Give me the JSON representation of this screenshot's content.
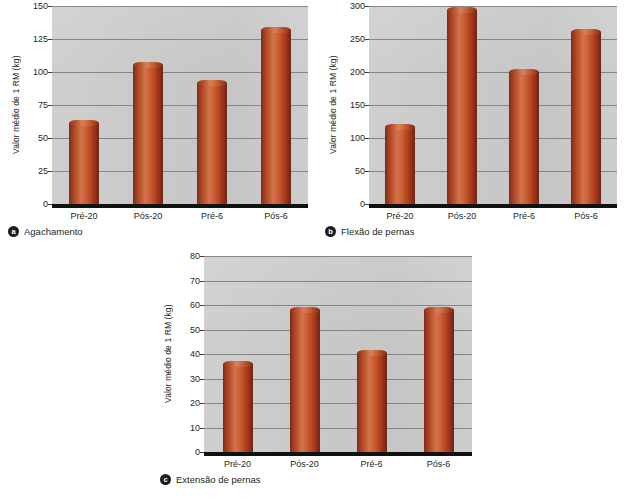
{
  "page": {
    "background": "#ffffff",
    "bar_color": "#c0572f",
    "plot_background": "#c8c8c8",
    "grid_color": "#6e6e6e",
    "axis_color": "#111111",
    "footer_note": ""
  },
  "charts": [
    {
      "panel_letter": "a",
      "caption": "Agachamento",
      "ylabel": "Valor médio de 1 RM (kg)",
      "ticks": [
        0,
        25,
        50,
        75,
        100,
        125,
        150
      ],
      "categories": [
        "Pré-20",
        "Pós-20",
        "Pré-6",
        "Pós-6"
      ],
      "values": [
        61,
        105,
        92,
        132
      ]
    },
    {
      "panel_letter": "b",
      "caption": "Flexão de pernas",
      "ylabel": "Valor médio de 1 RM (kg)",
      "ticks": [
        0,
        50,
        100,
        150,
        200,
        250,
        300
      ],
      "categories": [
        "Pré-20",
        "Pós-20",
        "Pré-6",
        "Pós-6"
      ],
      "values": [
        117,
        294,
        200,
        261
      ]
    },
    {
      "panel_letter": "c",
      "caption": "Extensão de pernas",
      "ylabel": "Valor médio de 1 RM (kg)",
      "ticks": [
        0,
        10,
        20,
        30,
        40,
        50,
        60,
        70,
        80
      ],
      "categories": [
        "Pré-20",
        "Pós-20",
        "Pré-6",
        "Pós-6"
      ],
      "values": [
        36,
        58,
        40.5,
        58
      ]
    }
  ],
  "chart_data": [
    {
      "type": "bar",
      "title": "Agachamento",
      "panel": "a",
      "categories": [
        "Pré-20",
        "Pós-20",
        "Pré-6",
        "Pós-6"
      ],
      "values": [
        61,
        105,
        92,
        132
      ],
      "xlabel": "",
      "ylabel": "Valor médio de 1 RM (kg)",
      "ylim": [
        0,
        150
      ],
      "yticks": [
        0,
        25,
        50,
        75,
        100,
        125,
        150
      ],
      "grid": true,
      "legend": false
    },
    {
      "type": "bar",
      "title": "Flexão de pernas",
      "panel": "b",
      "categories": [
        "Pré-20",
        "Pós-20",
        "Pré-6",
        "Pós-6"
      ],
      "values": [
        117,
        294,
        200,
        261
      ],
      "xlabel": "",
      "ylabel": "Valor médio de 1 RM (kg)",
      "ylim": [
        0,
        300
      ],
      "yticks": [
        0,
        50,
        100,
        150,
        200,
        250,
        300
      ],
      "grid": true,
      "legend": false
    },
    {
      "type": "bar",
      "title": "Extensão de pernas",
      "panel": "c",
      "categories": [
        "Pré-20",
        "Pós-20",
        "Pré-6",
        "Pós-6"
      ],
      "values": [
        36,
        58,
        40.5,
        58
      ],
      "xlabel": "",
      "ylabel": "Valor médio de 1 RM (kg)",
      "ylim": [
        0,
        80
      ],
      "yticks": [
        0,
        10,
        20,
        30,
        40,
        50,
        60,
        70,
        80
      ],
      "grid": true,
      "legend": false
    }
  ]
}
